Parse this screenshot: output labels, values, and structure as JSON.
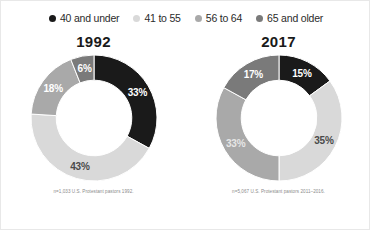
{
  "legend": {
    "items": [
      {
        "label": "40 and under",
        "color": "#1a1a1a",
        "icon": "legend-dot-icon"
      },
      {
        "label": "41 to 55",
        "color": "#d9d9d9",
        "icon": "legend-dot-icon"
      },
      {
        "label": "56 to 64",
        "color": "#a9a9a9",
        "icon": "legend-dot-icon"
      },
      {
        "label": "65 and older",
        "color": "#7a7a7a",
        "icon": "legend-dot-icon"
      }
    ]
  },
  "charts": [
    {
      "title": "1992",
      "note": "n=1,033 U.S. Protestant pastors 1992.",
      "labels": [
        "33%",
        "43%",
        "18%",
        "6%"
      ]
    },
    {
      "title": "2017",
      "note": "n=5,067 U.S. Protestant pastors 2011–2016.",
      "labels": [
        "15%",
        "35%",
        "33%",
        "17%"
      ]
    }
  ],
  "chart_data": [
    {
      "type": "pie",
      "title": "1992",
      "subtitle": "n=1,033 U.S. Protestant pastors 1992.",
      "categories": [
        "40 and under",
        "41 to 55",
        "56 to 64",
        "65 and older"
      ],
      "values": [
        33,
        43,
        18,
        6
      ],
      "value_labels": [
        "33%",
        "43%",
        "18%",
        "6%"
      ],
      "colors": [
        "#1a1a1a",
        "#d9d9d9",
        "#a9a9a9",
        "#7a7a7a"
      ],
      "label_text_colors": [
        "#ffffff",
        "#4a4a4a",
        "#ffffff",
        "#ffffff"
      ],
      "donut": true,
      "inner_radius_ratio": 0.6,
      "start_angle_deg": 0,
      "direction": "clockwise",
      "units": "percent",
      "legend_position": "top",
      "grid": false
    },
    {
      "type": "pie",
      "title": "2017",
      "subtitle": "n=5,067 U.S. Protestant pastors 2011–2016.",
      "categories": [
        "40 and under",
        "41 to 55",
        "56 to 64",
        "65 and older"
      ],
      "values": [
        15,
        35,
        33,
        17
      ],
      "value_labels": [
        "15%",
        "35%",
        "33%",
        "17%"
      ],
      "colors": [
        "#1a1a1a",
        "#d9d9d9",
        "#a9a9a9",
        "#7a7a7a"
      ],
      "label_text_colors": [
        "#ffffff",
        "#4a4a4a",
        "#e6e6e6",
        "#ffffff"
      ],
      "donut": true,
      "inner_radius_ratio": 0.6,
      "start_angle_deg": 0,
      "direction": "clockwise",
      "units": "percent",
      "legend_position": "top",
      "grid": false
    }
  ]
}
